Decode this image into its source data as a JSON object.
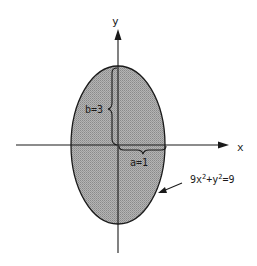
{
  "diagram": {
    "type": "ellipse-on-axes",
    "axes": {
      "x_label": "x",
      "y_label": "y"
    },
    "ellipse": {
      "equation_prefix": "9x",
      "equation_mid": "+y",
      "equation_suffix": "=9",
      "exp": "2",
      "fill_color": "#a9a9a9",
      "stroke_color": "#1a1a1a"
    },
    "annotations": {
      "semi_major_label": "b=3",
      "semi_minor_label": "a=1"
    }
  }
}
